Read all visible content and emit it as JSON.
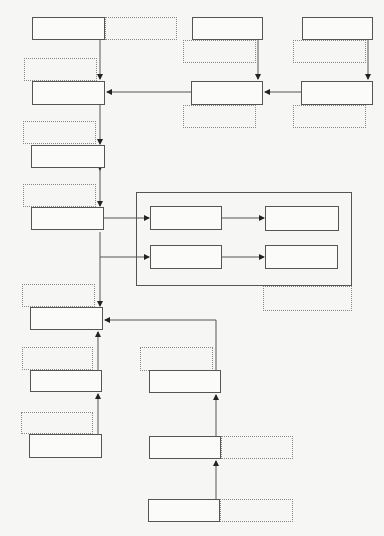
{
  "diagram": {
    "type": "flowchart",
    "nodes": [
      {
        "id": "L1",
        "label": ""
      },
      {
        "id": "L2",
        "label": ""
      },
      {
        "id": "L3",
        "label": ""
      },
      {
        "id": "L4",
        "label": ""
      },
      {
        "id": "L5",
        "label": ""
      },
      {
        "id": "L6",
        "label": ""
      },
      {
        "id": "L7",
        "label": ""
      },
      {
        "id": "M1",
        "label": ""
      },
      {
        "id": "M2",
        "label": ""
      },
      {
        "id": "R1",
        "label": ""
      },
      {
        "id": "R2",
        "label": ""
      },
      {
        "id": "G1",
        "label": ""
      },
      {
        "id": "G2",
        "label": ""
      },
      {
        "id": "G3",
        "label": ""
      },
      {
        "id": "G4",
        "label": ""
      },
      {
        "id": "B1",
        "label": ""
      },
      {
        "id": "B2",
        "label": ""
      },
      {
        "id": "B3",
        "label": ""
      }
    ],
    "annotations": [
      {
        "id": "aL1",
        "label": ""
      },
      {
        "id": "aL2",
        "label": ""
      },
      {
        "id": "aL3",
        "label": ""
      },
      {
        "id": "aL4",
        "label": ""
      },
      {
        "id": "aL5",
        "label": ""
      },
      {
        "id": "aL6",
        "label": ""
      },
      {
        "id": "aL7",
        "label": ""
      },
      {
        "id": "aM1",
        "label": ""
      },
      {
        "id": "aM2",
        "label": ""
      },
      {
        "id": "aR1",
        "label": ""
      },
      {
        "id": "aR2",
        "label": ""
      },
      {
        "id": "aG",
        "label": ""
      },
      {
        "id": "aB1",
        "label": ""
      },
      {
        "id": "aB2",
        "label": ""
      },
      {
        "id": "aB3",
        "label": ""
      }
    ],
    "edges": [
      {
        "from": "L1",
        "to": "L2"
      },
      {
        "from": "M1",
        "to": "M2"
      },
      {
        "from": "R1",
        "to": "R2"
      },
      {
        "from": "R2",
        "to": "M2"
      },
      {
        "from": "M2",
        "to": "L2"
      },
      {
        "from": "L2",
        "to": "L3"
      },
      {
        "from": "L3",
        "to": "L4",
        "bidirectional": true
      },
      {
        "from": "L4",
        "to": "G1"
      },
      {
        "from": "L4",
        "to": "G3"
      },
      {
        "from": "G1",
        "to": "G2"
      },
      {
        "from": "G3",
        "to": "G4"
      },
      {
        "from": "L4",
        "to": "L5"
      },
      {
        "from": "L6",
        "to": "L5"
      },
      {
        "from": "L7",
        "to": "L6"
      },
      {
        "from": "B1",
        "to": "L5"
      },
      {
        "from": "B2",
        "to": "B1"
      },
      {
        "from": "B3",
        "to": "B2"
      }
    ]
  }
}
